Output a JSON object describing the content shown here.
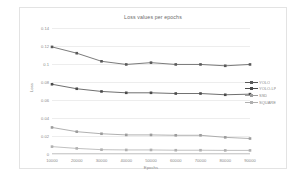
{
  "chart_data": {
    "type": "line",
    "title": "Loss values per epochs",
    "xlabel": "Epochs",
    "ylabel": "Loss",
    "grid": true,
    "legend_position": "right",
    "x": [
      10000,
      20000,
      30000,
      40000,
      50000,
      60000,
      70000,
      80000,
      90000
    ],
    "xtick_labels": [
      "10000",
      "20000",
      "30000",
      "40000",
      "50000",
      "60000",
      "70000",
      "80000",
      "90000"
    ],
    "ytick_labels": [
      "0",
      "0.02",
      "0.04",
      "0.06",
      "0.08",
      "0.1",
      "0.12",
      "0.14"
    ],
    "ytick_values": [
      0,
      0.02,
      0.04,
      0.06,
      0.08,
      0.1,
      0.12,
      0.14
    ],
    "ylim": [
      0,
      0.14
    ],
    "xlim": [
      10000,
      90000
    ],
    "series": [
      {
        "name": "YOLO",
        "color": "#595959",
        "values": [
          0.119,
          0.112,
          0.103,
          0.0995,
          0.1015,
          0.0995,
          0.0995,
          0.098,
          0.0995
        ]
      },
      {
        "name": "YOLO-LP",
        "color": "#4a4a4a",
        "values": [
          0.0775,
          0.0725,
          0.0695,
          0.068,
          0.068,
          0.0672,
          0.0672,
          0.0658,
          0.0665
        ]
      },
      {
        "name": "SSD",
        "color": "#9c9c9c",
        "values": [
          0.0295,
          0.0248,
          0.0225,
          0.0212,
          0.0212,
          0.0208,
          0.0208,
          0.0185,
          0.0172
        ]
      },
      {
        "name": "SQUARE",
        "color": "#b0b0b0",
        "values": [
          0.0082,
          0.0062,
          0.0048,
          0.0045,
          0.0045,
          0.0042,
          0.0042,
          0.004,
          0.004
        ]
      }
    ]
  }
}
